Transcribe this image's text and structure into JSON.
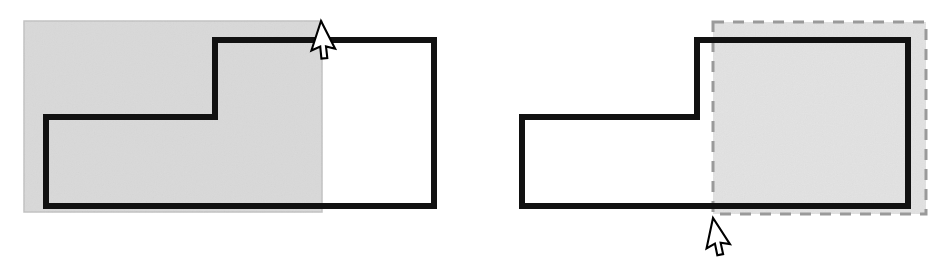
{
  "figure": {
    "width": 949,
    "height": 268,
    "background_color": "#ffffff",
    "outline_color": "#111111",
    "outline_width": 6,
    "fill_selection_color": "#d9d9d9",
    "dashed_border_color": "#9a9a9a",
    "cursor_fill_color": "#ffffff",
    "cursor_outline_color": "#000000"
  },
  "panels": [
    {
      "id": "panel-left",
      "label": "Solid shaded marquee over step shape",
      "selection_rect": {
        "style": "solid-fill",
        "fill": "#d9d9d9",
        "stroke": "#c2c2c2",
        "x": 24,
        "y": 21,
        "width": 298,
        "height": 191
      },
      "shape": {
        "name": "step-polygon",
        "points": "46,117 215,117 215,40 434,40 434,206 46,206",
        "fill": "none",
        "stroke": "#111111",
        "stroke_width": 6
      },
      "cursor": {
        "name": "arrow-pointer",
        "tip_x": 321,
        "tip_y": 21,
        "rotation": 18
      }
    },
    {
      "id": "panel-right",
      "label": "Dashed marquee over mirrored step shape",
      "selection_rect": {
        "style": "dashed-outline",
        "fill": "#e2e2e2",
        "stroke": "#9a9a9a",
        "stroke_width": 3,
        "dash_pattern": "11 9",
        "x": 713,
        "y": 22,
        "width": 213,
        "height": 192
      },
      "shape": {
        "name": "step-polygon-mirrored",
        "points": "522,117 697,117 697,40 908,40 908,206 522,206",
        "fill": "none",
        "stroke": "#111111",
        "stroke_width": 6
      },
      "cursor": {
        "name": "arrow-pointer",
        "tip_x": 713,
        "tip_y": 218,
        "rotation": 12
      }
    }
  ]
}
